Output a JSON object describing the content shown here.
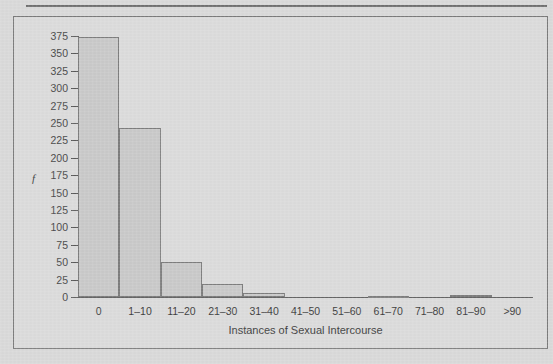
{
  "chart_data": {
    "type": "bar",
    "title": "",
    "subtitle": "",
    "xlabel": "Instances of Sexual Intercourse",
    "ylabel": "f",
    "categories": [
      "0",
      "1–10",
      "11–20",
      "21–30",
      "31–40",
      "41–50",
      "51–60",
      "61–70",
      "71–80",
      "81–90",
      ">90"
    ],
    "values": [
      373,
      243,
      51,
      18,
      6,
      0,
      0,
      2,
      0,
      3,
      0
    ],
    "ylim": [
      0,
      375
    ],
    "xlim": [
      0,
      11
    ],
    "y_ticks": [
      0,
      25,
      50,
      75,
      100,
      125,
      150,
      175,
      200,
      225,
      250,
      275,
      300,
      325,
      350,
      375
    ],
    "y_tick_labels": [
      "0",
      "25",
      "50",
      "75",
      "100",
      "125",
      "150",
      "175",
      "200",
      "225",
      "250",
      "275",
      "300",
      "325",
      "350",
      "375"
    ],
    "grid": false,
    "legend": null,
    "legend_position": "none",
    "bar_fill_color": "#c9c9c9",
    "bar_border_color": "#7d7d7d",
    "axis_color": "#5a5a5a",
    "text_color": "#3f3f3f",
    "plot_background_color": "#dbdbdb",
    "page_background_color": "#d9d9d9"
  },
  "figure": {
    "has_top_rule": true,
    "has_border_box": true
  }
}
